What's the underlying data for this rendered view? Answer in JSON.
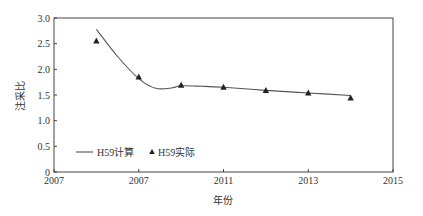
{
  "chart_data": {
    "type": "line",
    "title": "",
    "xlabel": "年份",
    "ylabel": "注采比",
    "xlim": [
      2007,
      2015
    ],
    "ylim": [
      0,
      3.0
    ],
    "grid": false,
    "legend_position": "lower-left",
    "x_ticks": [
      {
        "value": 2007,
        "label": "2007"
      },
      {
        "value": 2009,
        "label": "2007"
      },
      {
        "value": 2011,
        "label": "2011"
      },
      {
        "value": 2013,
        "label": "2013"
      },
      {
        "value": 2015,
        "label": "2015"
      }
    ],
    "y_ticks": [
      {
        "value": 0,
        "label": "0"
      },
      {
        "value": 0.5,
        "label": "0.5"
      },
      {
        "value": 1.0,
        "label": "1.0"
      },
      {
        "value": 1.5,
        "label": "1.5"
      },
      {
        "value": 2.0,
        "label": "2.0"
      },
      {
        "value": 2.5,
        "label": "2.5"
      },
      {
        "value": 3.0,
        "label": "3.0"
      }
    ],
    "series": [
      {
        "name": "H59计算",
        "style": "line",
        "x": [
          2008,
          2008.5,
          2009,
          2009.4,
          2009.8,
          2010,
          2010.5,
          2011,
          2012,
          2013,
          2014
        ],
        "values": [
          2.78,
          2.25,
          1.82,
          1.63,
          1.64,
          1.68,
          1.67,
          1.65,
          1.59,
          1.54,
          1.49
        ]
      },
      {
        "name": "H59实际",
        "style": "triangle-marker",
        "x": [
          2008,
          2009,
          2010,
          2011,
          2012,
          2013,
          2014
        ],
        "values": [
          2.55,
          1.85,
          1.69,
          1.65,
          1.59,
          1.54,
          1.44
        ]
      }
    ]
  },
  "legend": {
    "items": [
      {
        "label": "H59计算",
        "symbol": "line"
      },
      {
        "label": "H59实际",
        "symbol": "triangle"
      }
    ]
  },
  "axes": {
    "xlabel": "年份",
    "ylabel": "注采比"
  },
  "colors": {
    "line": "#555555",
    "marker": "#222222",
    "axis": "#444444"
  }
}
